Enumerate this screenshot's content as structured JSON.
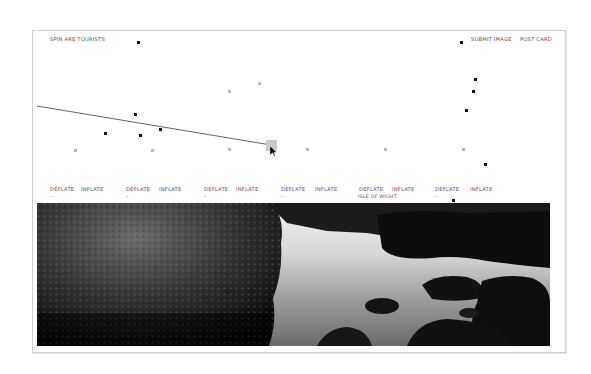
{
  "header": {
    "title": "SPIN ARE TOURISTS",
    "submit_label": "SUBMIT IMAGE",
    "postcard_label": "POST CARD"
  },
  "controls": [
    {
      "deflate": "DEFLATE",
      "inflate": "INFLATE",
      "value": "–",
      "caption": ""
    },
    {
      "deflate": "DEFLATE",
      "inflate": "INFLATE",
      "value": "–",
      "caption": ""
    },
    {
      "deflate": "DEFLATE",
      "inflate": "INFLATE",
      "value": "–",
      "caption": ""
    },
    {
      "deflate": "DEFLATE",
      "inflate": "INFLATE",
      "value": "–",
      "caption": ""
    },
    {
      "deflate": "DEFLATE",
      "inflate": "INFLATE",
      "value": "",
      "caption": "ISLE OF WIGHT"
    },
    {
      "deflate": "DEFLATE",
      "inflate": "INFLATE",
      "value": "–",
      "caption": ""
    }
  ],
  "photo": {
    "description": "black and white coastal rock pool photograph",
    "location": "ISLE OF WIGHT"
  },
  "points": {
    "black": [
      [
        138,
        42
      ],
      [
        461,
        42
      ],
      [
        475,
        79
      ],
      [
        473,
        91
      ],
      [
        466,
        110
      ],
      [
        135,
        114
      ],
      [
        105,
        133
      ],
      [
        140,
        135
      ],
      [
        160,
        129
      ],
      [
        485,
        164
      ],
      [
        453,
        200
      ]
    ],
    "gray": [
      [
        75,
        150
      ],
      [
        152,
        150
      ],
      [
        229,
        91
      ],
      [
        259,
        83
      ],
      [
        229,
        149
      ],
      [
        307,
        149
      ],
      [
        385,
        149
      ],
      [
        463,
        149
      ]
    ]
  },
  "line": {
    "x1": 37,
    "y1": 106,
    "x2": 271,
    "y2": 145
  },
  "colors": {
    "frame": "#cfcfcf",
    "point": "#111111",
    "gray_point": "#b8b8b8",
    "line": "#666666"
  }
}
